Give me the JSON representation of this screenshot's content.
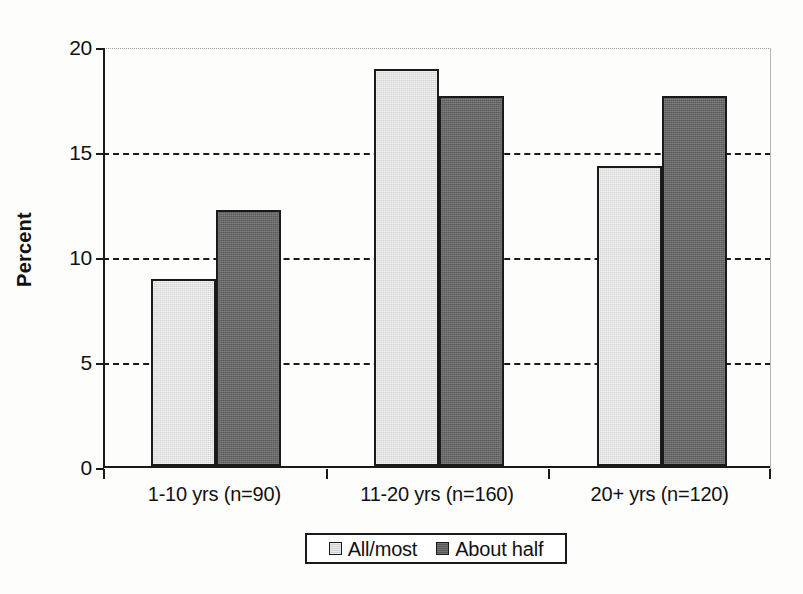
{
  "chart_data": {
    "type": "bar",
    "title": "",
    "xlabel": "",
    "ylabel": "Percent",
    "ylim": [
      0,
      20
    ],
    "yticks": [
      0,
      5,
      10,
      15,
      20
    ],
    "ytick_labels": [
      "0",
      "5",
      "10",
      "15",
      "20"
    ],
    "grid": "horizontal-dashed",
    "legend_position": "bottom-center",
    "categories": [
      "1-10 yrs (n=90)",
      "11-20 yrs (n=160)",
      "20+ yrs (n=120)"
    ],
    "series": [
      {
        "name": "All/most",
        "color": "#d2d2d2",
        "values": [
          8.9,
          18.9,
          14.3
        ]
      },
      {
        "name": "About half",
        "color": "#575757",
        "values": [
          12.2,
          17.6,
          17.6
        ]
      }
    ]
  },
  "legend": {
    "entries": [
      {
        "label": "All/most",
        "swatch": "light-gray-swatch-icon"
      },
      {
        "label": "About half",
        "swatch": "dark-gray-swatch-icon"
      }
    ]
  },
  "axes": {
    "y_title": "Percent"
  }
}
